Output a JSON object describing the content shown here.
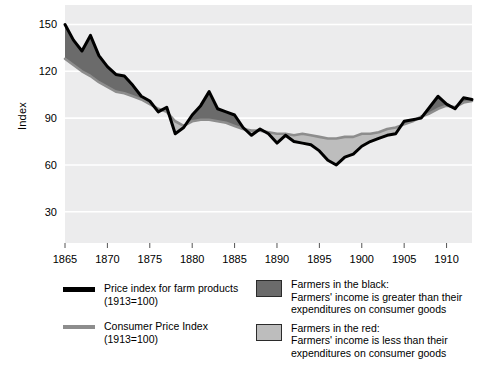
{
  "axes": {
    "ylabel": "Index",
    "yticks": [
      150,
      120,
      90,
      60,
      30
    ],
    "xticks": [
      1865,
      1870,
      1875,
      1880,
      1885,
      1890,
      1895,
      1900,
      1905,
      1910
    ]
  },
  "legend": {
    "series": [
      {
        "name": "farm-price-index",
        "label": "Price index for farm products",
        "sublabel": "(1913=100)",
        "color": "#000000"
      },
      {
        "name": "consumer-price-index",
        "label": "Consumer Price Index",
        "sublabel": "(1913=100)",
        "color": "#8d8d8d"
      }
    ],
    "bands": [
      {
        "name": "farmers-in-the-black",
        "title": "Farmers in the black:",
        "line1": "Farmers' income is greater than their",
        "line2": "expenditures on consumer goods",
        "color": "#6b6b6b"
      },
      {
        "name": "farmers-in-the-red",
        "title": "Farmers in the red:",
        "line1": "Farmers' income is less than their",
        "line2": "expenditures on consumer goods",
        "color": "#bdbdbd"
      }
    ]
  },
  "chart_data": {
    "type": "line",
    "title": "",
    "xlabel": "",
    "ylabel": "Index",
    "xlim": [
      1865,
      1913
    ],
    "ylim": [
      10,
      158
    ],
    "grid": true,
    "grid_color": "#ffffff",
    "plot_background": "#ececed",
    "legend_position": "below",
    "fill_above_label": "Farmers in the black",
    "fill_below_label": "Farmers in the red",
    "x": [
      1865,
      1866,
      1867,
      1868,
      1869,
      1870,
      1871,
      1872,
      1873,
      1874,
      1875,
      1876,
      1877,
      1878,
      1879,
      1880,
      1881,
      1882,
      1883,
      1884,
      1885,
      1886,
      1887,
      1888,
      1889,
      1890,
      1891,
      1892,
      1893,
      1894,
      1895,
      1896,
      1897,
      1898,
      1899,
      1900,
      1901,
      1902,
      1903,
      1904,
      1905,
      1906,
      1907,
      1908,
      1909,
      1910,
      1911,
      1912,
      1913
    ],
    "series": [
      {
        "name": "Price index for farm products (1913=100)",
        "color": "#000000",
        "values": [
          150,
          140,
          133,
          143,
          130,
          123,
          118,
          117,
          111,
          104,
          101,
          94,
          97,
          80,
          84,
          92,
          98,
          107,
          96,
          94,
          92,
          84,
          79,
          83,
          80,
          74,
          79,
          75,
          74,
          73,
          69,
          63,
          60,
          65,
          67,
          72,
          75,
          77,
          79,
          80,
          88,
          89,
          90,
          97,
          104,
          99,
          96,
          103,
          102
        ]
      },
      {
        "name": "Consumer Price Index (1913=100)",
        "color": "#8d8d8d",
        "values": [
          128,
          124,
          120,
          117,
          113,
          110,
          107,
          106,
          104,
          102,
          99,
          96,
          94,
          88,
          85,
          88,
          89,
          89,
          88,
          87,
          85,
          83,
          82,
          82,
          81,
          80,
          80,
          79,
          80,
          79,
          78,
          77,
          77,
          78,
          78,
          80,
          80,
          81,
          83,
          84,
          86,
          88,
          91,
          93,
          96,
          98,
          97,
          100,
          101
        ]
      }
    ]
  }
}
